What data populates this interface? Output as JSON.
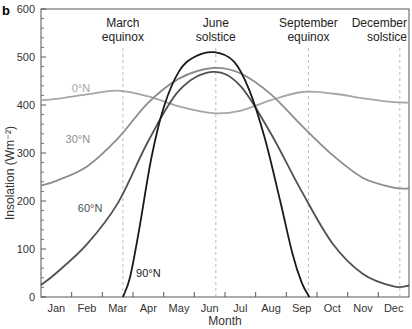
{
  "panel_label": "b",
  "chart_data": {
    "type": "line",
    "title": "",
    "xlabel": "Month",
    "ylabel": "Insolation (Wm⁻²)",
    "ylim": [
      0,
      600
    ],
    "yticks": [
      0,
      100,
      200,
      300,
      400,
      500,
      600
    ],
    "categories": [
      "Jan",
      "Feb",
      "Mar",
      "Apr",
      "May",
      "Jun",
      "Jul",
      "Aug",
      "Sep",
      "Oct",
      "Nov",
      "Dec"
    ],
    "grid": false,
    "events": [
      {
        "label_line1": "March",
        "label_line2": "equinox",
        "month_pos": 2.67
      },
      {
        "label_line1": "June",
        "label_line2": "solstice",
        "month_pos": 5.7
      },
      {
        "label_line1": "September",
        "label_line2": "equinox",
        "month_pos": 8.72
      },
      {
        "label_line1": "December",
        "label_line2": "solstice",
        "month_pos": 11.7
      }
    ],
    "series": [
      {
        "name": "0°N",
        "color": "#a6a6a6",
        "label_pos": [
          1.0,
          428
        ],
        "x": [
          0,
          0.5,
          1.5,
          2.5,
          3.5,
          4.5,
          5.6,
          6.5,
          7.5,
          8.5,
          9.5,
          10.5,
          11.5,
          12
        ],
        "values": [
          410,
          413,
          422,
          430,
          418,
          397,
          383,
          388,
          410,
          427,
          424,
          414,
          406,
          405
        ]
      },
      {
        "name": "30°N",
        "color": "#8c8c8c",
        "label_pos": [
          0.8,
          320
        ],
        "x": [
          0,
          0.5,
          1.5,
          2.5,
          3.5,
          4.5,
          5.6,
          6.5,
          7.5,
          8.5,
          9.5,
          10.5,
          11.5,
          12
        ],
        "values": [
          232,
          242,
          272,
          330,
          405,
          455,
          477,
          466,
          422,
          357,
          296,
          248,
          228,
          226
        ]
      },
      {
        "name": "60°N",
        "color": "#505050",
        "label_pos": [
          1.2,
          178
        ],
        "x": [
          0,
          0.5,
          1.5,
          2.5,
          3.5,
          4.5,
          5.6,
          6.5,
          7.5,
          8.5,
          9.5,
          10.5,
          11.5,
          12
        ],
        "values": [
          25,
          50,
          110,
          195,
          325,
          430,
          469,
          440,
          340,
          220,
          112,
          48,
          22,
          24
        ]
      },
      {
        "name": "90°N",
        "color": "#1a1a1a",
        "label_pos": [
          3.1,
          42
        ],
        "x": [
          2.67,
          2.9,
          3.2,
          3.6,
          4.0,
          4.5,
          5.0,
          5.65,
          6.3,
          6.8,
          7.3,
          7.8,
          8.2,
          8.5,
          8.75
        ],
        "values": [
          0,
          40,
          140,
          290,
          395,
          470,
          500,
          510,
          490,
          430,
          330,
          200,
          90,
          30,
          0
        ]
      }
    ]
  }
}
